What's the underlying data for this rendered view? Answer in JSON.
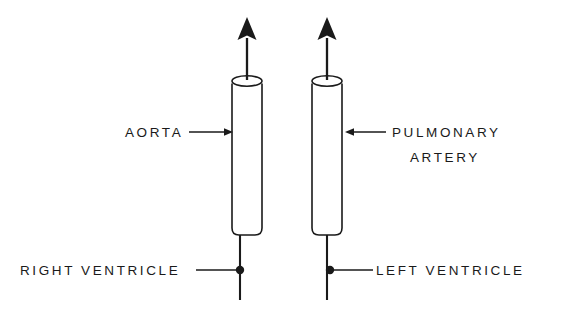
{
  "figure": {
    "background_color": "#ffffff",
    "ink_color": "#1a1a1a",
    "width": 561,
    "height": 318
  },
  "labels": {
    "aorta": "AORTA",
    "pulmonary_line1": "PULMONARY",
    "pulmonary_line2": "ARTERY",
    "right_ventricle": "RIGHT  VENTRICLE",
    "left_ventricle": "LEFT  VENTRICLE"
  },
  "parts": {
    "left_vessel": {
      "name": "aorta-cylinder",
      "x": 232,
      "y": 78,
      "width": 30,
      "height": 157
    },
    "right_vessel": {
      "name": "pulmonary-artery-cylinder",
      "x": 312,
      "y": 78,
      "width": 30,
      "height": 157
    },
    "left_flow_arrow": {
      "name": "aortic-flow-arrow",
      "tip_y": 18,
      "base_y": 80,
      "x": 247
    },
    "right_flow_arrow": {
      "name": "pulmonary-flow-arrow",
      "tip_y": 18,
      "base_y": 80,
      "x": 327
    },
    "right_ventricle_marker": {
      "name": "right-ventricle-dot",
      "cx": 240,
      "cy": 270,
      "r": 4.2
    },
    "left_ventricle_marker": {
      "name": "left-ventricle-dot",
      "cx": 330,
      "cy": 270,
      "r": 4.2
    }
  }
}
